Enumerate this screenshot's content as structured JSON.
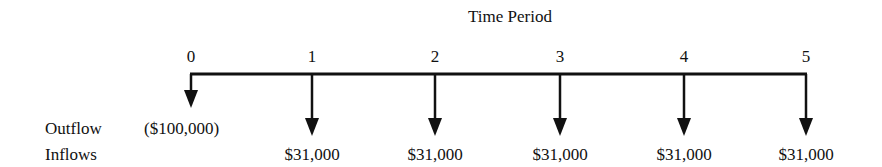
{
  "title": "Time Period",
  "row_labels": {
    "outflow": "Outflow",
    "inflows": "Inflows"
  },
  "periods": [
    {
      "label": "0",
      "outflow": "($100,000)",
      "inflow": ""
    },
    {
      "label": "1",
      "outflow": "",
      "inflow": "$31,000"
    },
    {
      "label": "2",
      "outflow": "",
      "inflow": "$31,000"
    },
    {
      "label": "3",
      "outflow": "",
      "inflow": "$31,000"
    },
    {
      "label": "4",
      "outflow": "",
      "inflow": "$31,000"
    },
    {
      "label": "5",
      "outflow": "",
      "inflow": "$31,000"
    }
  ],
  "colors": {
    "line": "#111111",
    "text": "#111111"
  }
}
